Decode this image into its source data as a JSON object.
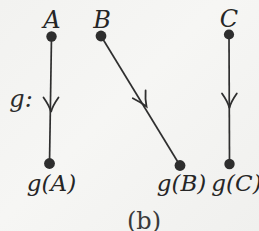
{
  "figure": {
    "function_label": "g:",
    "caption": "(b)",
    "mappings": [
      {
        "from": "A",
        "to": "g(A)"
      },
      {
        "from": "B",
        "to": "g(B)"
      },
      {
        "from": "C",
        "to": "g(C)"
      }
    ],
    "colors": {
      "ink": "#2f2f2f",
      "paper": "#f2f2f0"
    }
  }
}
